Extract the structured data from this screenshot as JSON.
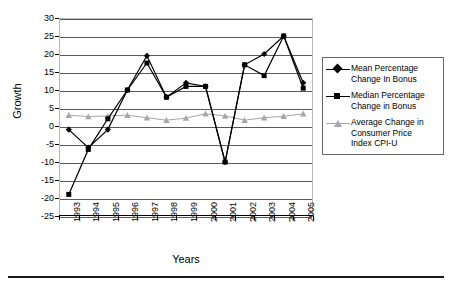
{
  "chart_data": {
    "type": "line",
    "title": "",
    "xlabel": "Years",
    "ylabel": "Growth",
    "categories": [
      "1993",
      "1994",
      "1995",
      "1996",
      "1997",
      "1998",
      "1999",
      "2000",
      "2001",
      "2002",
      "2003",
      "2004",
      "2005"
    ],
    "ylim": [
      -25,
      30
    ],
    "ytick_step": 5,
    "yticks": [
      30,
      25,
      20,
      15,
      10,
      5,
      0,
      -5,
      -10,
      -15,
      -20,
      -25
    ],
    "ytick_labels": [
      "30",
      "25",
      "20",
      "15",
      "10",
      "5",
      "0",
      "-5",
      "-10",
      "-15",
      "-20",
      "-25"
    ],
    "grid": true,
    "grid_axis": "y",
    "legend_position": "right",
    "series": [
      {
        "name": "Mean Percentage Change In Bonus",
        "marker": "diamond",
        "color": "#000000",
        "values": [
          -1,
          -6,
          -1,
          10,
          19.5,
          8,
          12,
          11,
          -10,
          17,
          20,
          25,
          12
        ]
      },
      {
        "name": "Median Percentage Change in Bonus",
        "marker": "square",
        "color": "#000000",
        "values": [
          -19,
          -6.5,
          2,
          10,
          17.5,
          8,
          11,
          11,
          -10,
          17,
          14,
          25,
          10.5
        ]
      },
      {
        "name": "Average Change in Consumer Price Index CPI-U",
        "marker": "triangle",
        "color": "#a6a6a6",
        "values": [
          3,
          2.6,
          2.8,
          3,
          2.3,
          1.6,
          2.2,
          3.4,
          2.8,
          1.6,
          2.3,
          2.7,
          3.4
        ]
      }
    ]
  },
  "legend": {
    "items": [
      {
        "label_line1": "Mean Percentage",
        "label_line2": "Change In Bonus",
        "marker": "diamond-marker",
        "color": "#000000"
      },
      {
        "label_line1": "Median Percentage",
        "label_line2": "Change in Bonus",
        "marker": "square-marker",
        "color": "#000000"
      },
      {
        "label_line1": "Average Change in",
        "label_line2": "Consumer Price",
        "label_line3": "Index CPI-U",
        "marker": "triangle-marker",
        "color": "#a6a6a6"
      }
    ]
  },
  "axes": {
    "y_title": "Growth",
    "x_title": "Years"
  }
}
